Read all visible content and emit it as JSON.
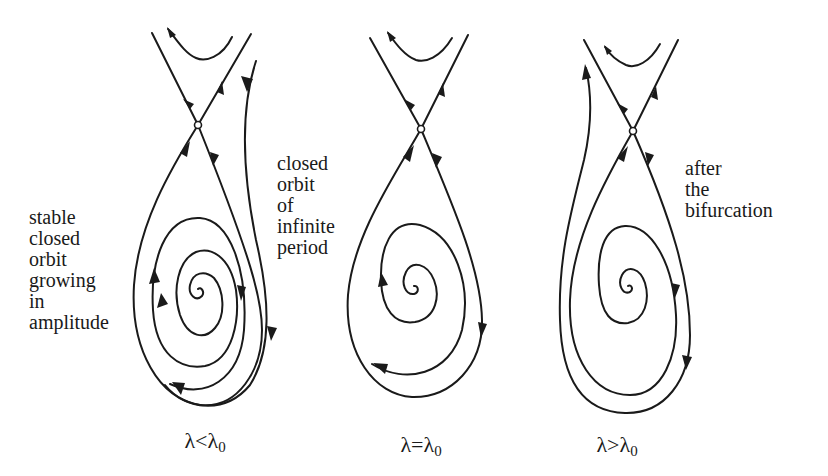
{
  "figure": {
    "type": "phase-portrait-series",
    "panels": [
      {
        "id": "before",
        "caption_main": "λ<λ",
        "caption_sub": "0",
        "annotations": [
          {
            "id": "left-note",
            "text": "stable\nclosed\norbit\ngrowing\nin\namplitude"
          },
          {
            "id": "right-note",
            "text": "closed\norbit\nof\ninfinite\nperiod"
          }
        ],
        "elements": [
          "saddle point",
          "upper hyperbolic trajectory",
          "stable manifold branches",
          "unstable manifold branches",
          "outer spiral trajectory",
          "inward spiral",
          "limit cycle"
        ]
      },
      {
        "id": "critical",
        "caption_main": "λ=λ",
        "caption_sub": "0",
        "annotations": [],
        "elements": [
          "saddle point",
          "upper hyperbolic trajectory",
          "homoclinic loop",
          "inward spiral"
        ]
      },
      {
        "id": "after",
        "caption_main": "λ>λ",
        "caption_sub": "0",
        "annotations": [
          {
            "id": "right-note",
            "text": "after\nthe\nbifurcation"
          }
        ],
        "elements": [
          "saddle point",
          "upper hyperbolic trajectory",
          "escaping outer trajectory",
          "unstable manifold loop",
          "inward spiral"
        ]
      }
    ]
  },
  "colors": {
    "ink": "#1a1a1a",
    "paper": "#ffffff"
  }
}
